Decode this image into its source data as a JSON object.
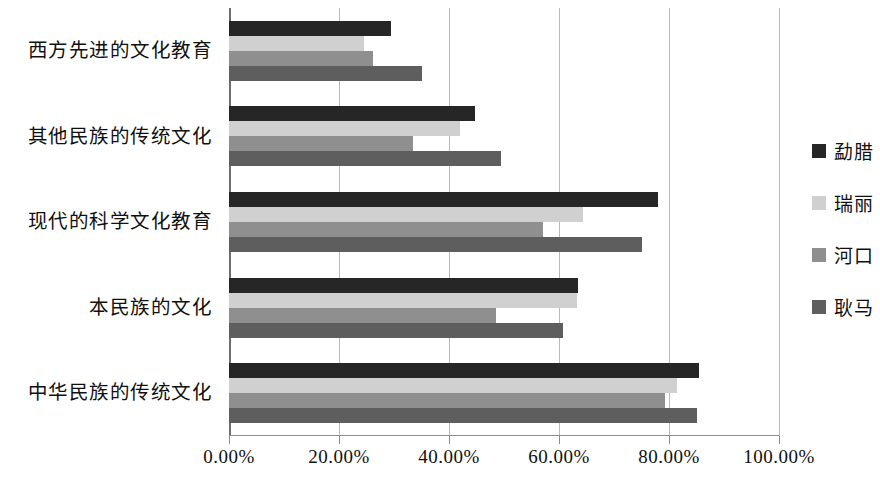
{
  "chart_data": {
    "type": "bar",
    "orientation": "horizontal",
    "title": "",
    "xlabel": "",
    "ylabel": "",
    "xlim": [
      0,
      100
    ],
    "xticks": [
      "0.00%",
      "20.00%",
      "40.00%",
      "60.00%",
      "80.00%",
      "100.00%"
    ],
    "xtick_values": [
      0,
      20,
      40,
      60,
      80,
      100
    ],
    "grid": true,
    "legend_position": "right",
    "categories": [
      "西方先进的文化教育",
      "其他民族的传统文化",
      "现代的科学文化教育",
      "本民族的文化",
      "中华民族的传统文化"
    ],
    "series": [
      {
        "name": "勐腊",
        "color": "#262626",
        "values": [
          29.5,
          44.7,
          78.0,
          63.5,
          85.4
        ]
      },
      {
        "name": "瑞丽",
        "color": "#d0d0d0",
        "values": [
          24.5,
          42.0,
          64.4,
          63.3,
          81.4
        ]
      },
      {
        "name": "河口",
        "color": "#8f8f8f",
        "values": [
          26.2,
          33.5,
          57.0,
          48.5,
          79.3
        ]
      },
      {
        "name": "耿马",
        "color": "#5e5e5e",
        "values": [
          35.0,
          49.5,
          75.0,
          60.8,
          85.1
        ]
      }
    ]
  },
  "axis": {
    "gridline_color": "#b9b9b9",
    "axis_color": "#8c8c8c"
  }
}
